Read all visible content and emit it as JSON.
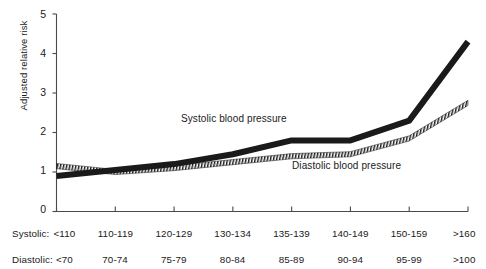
{
  "chart_data": {
    "type": "line",
    "title": "",
    "xlabel": "",
    "ylabel": "Adjusted relative risk",
    "ylim": [
      0,
      5
    ],
    "yticks": [
      0,
      1,
      2,
      3,
      4,
      5
    ],
    "ytick_labels": [
      "0",
      "1",
      "2",
      "3",
      "4",
      "5"
    ],
    "grid": false,
    "legend_position": "inline-annotation",
    "categories": [
      "<110",
      "110-119",
      "120-129",
      "130-134",
      "135-139",
      "140-149",
      "150-159",
      ">160"
    ],
    "categories_secondary": [
      "<70",
      "70-74",
      "75-79",
      "80-84",
      "85-89",
      "90-94",
      "95-99",
      ">100"
    ],
    "category_axis_prefix": "Systolic:",
    "category_axis_prefix_secondary": "Diastolic:",
    "series": [
      {
        "name": "Systolic blood pressure",
        "values": [
          0.9,
          1.05,
          1.2,
          1.45,
          1.8,
          1.8,
          2.3,
          4.3
        ],
        "color": "#1a1a1a",
        "style": "solid-thick"
      },
      {
        "name": "Diastolic blood pressure",
        "values": [
          1.15,
          1.0,
          1.1,
          1.25,
          1.4,
          1.45,
          1.85,
          2.75
        ],
        "color": "#1a1a1a",
        "style": "hatched"
      }
    ],
    "annotations": [
      {
        "text": "Systolic blood pressure",
        "x_category": "130-134",
        "y_value": 2.05
      },
      {
        "text": "Diastolic blood pressure",
        "x_category": "140-149",
        "y_value": 1.35
      }
    ]
  },
  "axis": {
    "y_axis_title": "Adjusted relative risk",
    "y_tick_labels": [
      "5",
      "4",
      "3",
      "2",
      "1",
      "0"
    ],
    "x_row_systolic_prefix": "Systolic:",
    "x_row_diastolic_prefix": "Diastolic:",
    "x_row_systolic": [
      "<110",
      "110-119",
      "120-129",
      "130-134",
      "135-139",
      "140-149",
      "150-159",
      ">160"
    ],
    "x_row_diastolic": [
      "<70",
      "70-74",
      "75-79",
      "80-84",
      "85-89",
      "90-94",
      "95-99",
      ">100"
    ]
  },
  "legend": {
    "systolic": "Systolic blood pressure",
    "diastolic": "Diastolic blood pressure"
  },
  "colors": {
    "line": "#1a1a1a",
    "axis": "#4a4a4a",
    "background": "#ffffff",
    "text": "#1a1a1a"
  }
}
